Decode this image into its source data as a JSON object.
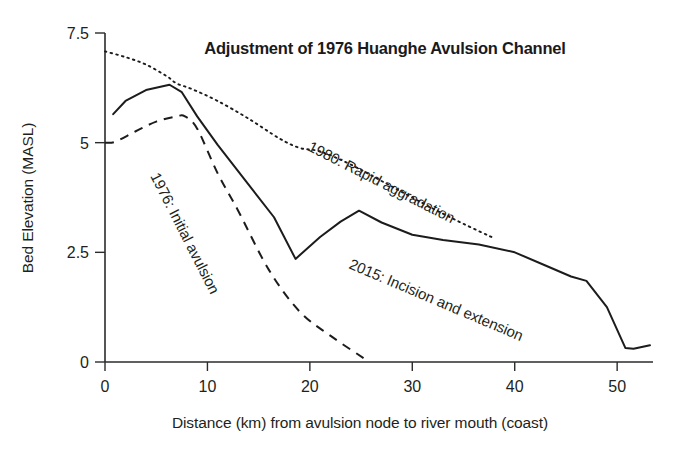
{
  "chart_data": {
    "type": "line",
    "title": "Adjustment of 1976 Huanghe Avulsion Channel",
    "xlabel": "Distance (km) from avulsion node to river mouth (coast)",
    "ylabel": "Bed Elevation (MASL)",
    "xlim": [
      0,
      53.5
    ],
    "ylim": [
      0,
      7.5
    ],
    "xticks": [
      0,
      10,
      20,
      30,
      40,
      50
    ],
    "xtick_labels": [
      "0",
      "10",
      "20",
      "30",
      "40",
      "50"
    ],
    "yticks": [
      0,
      2.5,
      5,
      7.5
    ],
    "ytick_labels": [
      "0",
      "2.5",
      "5",
      "7.5"
    ],
    "grid": false,
    "legend": "inline annotations along each curve",
    "line_color": "#1c1c1c",
    "series": [
      {
        "name": "1976: Initial avulsion",
        "style": "dashed",
        "annotation": "1976: Initial avulsion",
        "annotation_rotation_deg": 63,
        "x": [
          0.0,
          1.0,
          3.0,
          5.0,
          7.0,
          7.8,
          9.0,
          11.0,
          13.0,
          16.0,
          19.0,
          22.0,
          25.5
        ],
        "y": [
          5.0,
          5.02,
          5.26,
          5.48,
          5.6,
          5.6,
          5.32,
          4.3,
          3.45,
          2.1,
          1.15,
          0.6,
          0.05
        ]
      },
      {
        "name": "1980: Rapid aggradation",
        "style": "dotted",
        "annotation": "1980: Rapid aggradation",
        "annotation_rotation_deg": 27,
        "x": [
          0.0,
          2.0,
          4.0,
          6.0,
          7.0,
          8.5,
          11.0,
          14.0,
          17.0,
          19.0,
          21.0,
          24.0,
          28.0,
          32.0,
          35.0,
          38.0
        ],
        "y": [
          7.08,
          6.95,
          6.78,
          6.52,
          6.35,
          6.22,
          5.95,
          5.55,
          5.1,
          4.88,
          4.8,
          4.5,
          4.0,
          3.5,
          3.15,
          2.82
        ]
      },
      {
        "name": "2015: Incision and extension",
        "style": "solid",
        "annotation": "2015: Incision and extension",
        "annotation_rotation_deg": 23,
        "x": [
          0.8,
          2.0,
          4.0,
          6.3,
          7.5,
          9.0,
          11.0,
          14.0,
          16.5,
          18.6,
          21.0,
          23.0,
          24.8,
          27.0,
          30.0,
          33.0,
          36.5,
          40.0,
          43.0,
          45.5,
          47.0,
          49.0,
          50.8,
          51.6,
          53.2
        ],
        "y": [
          5.65,
          5.95,
          6.2,
          6.32,
          6.15,
          5.6,
          4.95,
          4.05,
          3.3,
          2.35,
          2.85,
          3.2,
          3.45,
          3.18,
          2.9,
          2.78,
          2.68,
          2.5,
          2.2,
          1.95,
          1.85,
          1.25,
          0.32,
          0.3,
          0.38
        ]
      }
    ]
  }
}
